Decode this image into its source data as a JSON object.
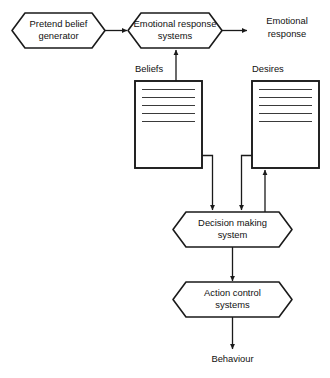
{
  "diagram": {
    "colors": {
      "background": "#ffffff",
      "stroke": "#1a1a1a",
      "text": "#111111",
      "rule": "#3a3a3a"
    },
    "nodes": {
      "pretend_belief_generator": {
        "label_line1": "Pretend belief",
        "label_line2": "generator",
        "shape": "hexagon"
      },
      "emotional_response_systems": {
        "label_line1": "Emotional response",
        "label_line2": "systems",
        "shape": "hexagon"
      },
      "decision_making_system": {
        "label_line1": "Decision making",
        "label_line2": "system",
        "shape": "hexagon"
      },
      "action_control_systems": {
        "label_line1": "Action control",
        "label_line2": "systems",
        "shape": "hexagon"
      },
      "beliefs_store": {
        "caption": "Beliefs",
        "shape": "document-box",
        "line_count": 5
      },
      "desires_store": {
        "caption": "Desires",
        "shape": "document-box",
        "line_count": 5
      }
    },
    "free_labels": {
      "emotional_response_output_line1": "Emotional",
      "emotional_response_output_line2": "response",
      "behaviour_output": "Behaviour"
    },
    "edges": [
      {
        "from": "pretend_belief_generator",
        "to": "emotional_response_systems",
        "arrow": "end"
      },
      {
        "from": "emotional_response_systems",
        "to": "emotional_response_output",
        "arrow": "end"
      },
      {
        "from": "beliefs_store",
        "to": "emotional_response_systems",
        "arrow": "end"
      },
      {
        "from": "beliefs_store",
        "to": "decision_making_system",
        "arrow": "end"
      },
      {
        "from": "desires_store",
        "to": "decision_making_system",
        "arrow": "end"
      },
      {
        "from": "decision_making_system",
        "to": "desires_store",
        "arrow": "end"
      },
      {
        "from": "decision_making_system",
        "to": "action_control_systems",
        "arrow": "end"
      },
      {
        "from": "action_control_systems",
        "to": "behaviour_output",
        "arrow": "end"
      }
    ]
  }
}
